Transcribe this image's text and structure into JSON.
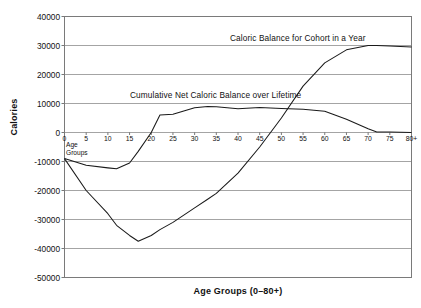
{
  "chart_data": {
    "type": "line",
    "title": "",
    "xlabel": "Age Groups (0–80+)",
    "ylabel": "Calories",
    "xlim": [
      0,
      80
    ],
    "ylim": [
      -50000,
      40000
    ],
    "grid": true,
    "legend_position": "inline-annotations",
    "x_tick_labels": [
      "0",
      "5",
      "10",
      "15",
      "20",
      "25",
      "30",
      "35",
      "40",
      "45",
      "50",
      "55",
      "60",
      "65",
      "70",
      "75",
      "80+"
    ],
    "y_tick_labels": [
      "40000",
      "30000",
      "20000",
      "10000",
      "0",
      "-10000",
      "-20000",
      "-30000",
      "-40000",
      "-50000"
    ],
    "y_ticks": [
      40000,
      30000,
      20000,
      10000,
      0,
      -10000,
      -20000,
      -30000,
      -40000,
      -50000
    ],
    "x": [
      0,
      5,
      10,
      12,
      15,
      17,
      20,
      22,
      25,
      30,
      33,
      35,
      40,
      45,
      50,
      55,
      60,
      65,
      70,
      72,
      75,
      80
    ],
    "series": [
      {
        "name": "Caloric Balance for Cohort in a Year",
        "label": "Caloric Balance for Cohort in a Year",
        "color": "#1a1a1a",
        "values": [
          -9000,
          -11300,
          -12200,
          -12500,
          -10500,
          -6500,
          0,
          6000,
          6300,
          8500,
          9000,
          8900,
          8200,
          8600,
          8300,
          8000,
          7300,
          4600,
          1300,
          200,
          200,
          0
        ]
      },
      {
        "name": "Cumulative Net Caloric Balance over Lifetime",
        "label": "Cumulative Net Caloric Balance over Lifetime",
        "color": "#1a1a1a",
        "values": [
          -9000,
          -20000,
          -28000,
          -32000,
          -35500,
          -37500,
          -35500,
          -33500,
          -31000,
          -26000,
          -23000,
          -21000,
          -14000,
          -5000,
          5000,
          16000,
          24000,
          28500,
          30000,
          30000,
          29800,
          29500
        ]
      }
    ],
    "annotations": [
      {
        "name": "annual-series-label",
        "text": "Caloric Balance for Cohort in a Year",
        "x_px": 230,
        "y_px": 38
      },
      {
        "name": "cumulative-series-label",
        "text": "Cumulative Net Caloric Balance over Lifetime",
        "x_px": 130,
        "y_px": 95
      },
      {
        "name": "axis-origin-note",
        "text": "Age\nGroups",
        "x_px": 66,
        "y_px": 141
      }
    ]
  },
  "plot": {
    "background": "#ffffff",
    "border_color": "#7a7a7a",
    "gridline_color": "#9a9a9a",
    "line_color": "#1a1a1a"
  }
}
